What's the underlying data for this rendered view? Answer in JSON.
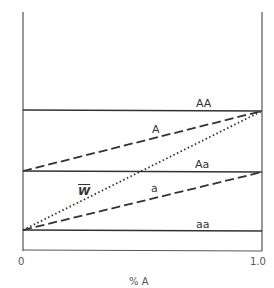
{
  "diagram": {
    "type": "fitness-frequency diagram",
    "x_axis": {
      "label": "% A",
      "ticks": [
        "0",
        "1.0"
      ]
    },
    "lines": {
      "AA": {
        "label": "AA",
        "style": "solid"
      },
      "Aa": {
        "label": "Aa",
        "style": "solid"
      },
      "aa": {
        "label": "aa",
        "style": "solid"
      },
      "A": {
        "label": "A",
        "style": "dashed"
      },
      "a": {
        "label": "a",
        "style": "dashed"
      },
      "W": {
        "label": "W",
        "style": "dotted"
      }
    },
    "colors": {
      "ink": "#333333",
      "axis": "#555555"
    }
  }
}
